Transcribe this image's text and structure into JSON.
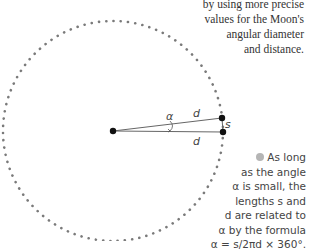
{
  "caption_top": {
    "lines": [
      "by using more precise",
      "values for the Moon's",
      "angular diameter",
      "and distance."
    ]
  },
  "diagram": {
    "labels": {
      "alpha": "α",
      "d_top": "d",
      "d_bottom": "d",
      "s": "s"
    },
    "colors": {
      "dots": "#7a7a7a",
      "lines": "#666666",
      "points": "#111111",
      "bullet": "#b5b5b5"
    }
  },
  "note": {
    "lines": [
      "As long",
      "as the angle",
      "α is small, the",
      "lengths s and",
      "d are related to",
      "α by the formula",
      "α = s/2πd × 360°."
    ]
  }
}
